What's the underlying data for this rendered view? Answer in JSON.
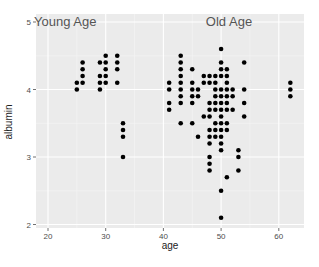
{
  "chart_data": {
    "type": "scatter",
    "title": "",
    "xlabel": "age",
    "ylabel": "albumin",
    "xlim": [
      18,
      64
    ],
    "ylim": [
      1.95,
      5.1
    ],
    "x_ticks": [
      20,
      30,
      40,
      50,
      60
    ],
    "y_ticks": [
      2,
      3,
      4,
      5
    ],
    "grid": true,
    "legend": null,
    "annotations": [
      {
        "text": "Young Age",
        "x": 26,
        "y": 5.0
      },
      {
        "text": "Old Age",
        "x": 50,
        "y": 5.0
      }
    ],
    "series": [
      {
        "name": "Young Age",
        "points": [
          [
            25,
            4.0
          ],
          [
            25,
            4.1
          ],
          [
            26,
            4.1
          ],
          [
            26,
            4.2
          ],
          [
            26,
            4.3
          ],
          [
            26,
            4.4
          ],
          [
            29,
            4.0
          ],
          [
            29,
            4.1
          ],
          [
            29,
            4.2
          ],
          [
            29,
            4.4
          ],
          [
            30,
            4.1
          ],
          [
            30,
            4.2
          ],
          [
            30,
            4.3
          ],
          [
            30,
            4.4
          ],
          [
            30,
            4.5
          ],
          [
            32,
            4.1
          ],
          [
            32,
            4.3
          ],
          [
            32,
            4.4
          ],
          [
            32,
            4.5
          ],
          [
            33,
            3.5
          ],
          [
            33,
            3.4
          ],
          [
            33,
            3.3
          ],
          [
            33,
            3.0
          ]
        ]
      },
      {
        "name": "Old Age",
        "points": [
          [
            41,
            3.7
          ],
          [
            41,
            3.8
          ],
          [
            41,
            4.0
          ],
          [
            41,
            4.1
          ],
          [
            43,
            3.5
          ],
          [
            43,
            3.8
          ],
          [
            43,
            3.9
          ],
          [
            43,
            4.0
          ],
          [
            43,
            4.1
          ],
          [
            43,
            4.2
          ],
          [
            43,
            4.3
          ],
          [
            43,
            4.4
          ],
          [
            43,
            4.5
          ],
          [
            45,
            3.5
          ],
          [
            45,
            3.8
          ],
          [
            45,
            3.9
          ],
          [
            45,
            4.0
          ],
          [
            45,
            4.1
          ],
          [
            45,
            4.3
          ],
          [
            46,
            3.3
          ],
          [
            46,
            3.9
          ],
          [
            46,
            4.0
          ],
          [
            47,
            3.6
          ],
          [
            47,
            4.1
          ],
          [
            47,
            4.2
          ],
          [
            48,
            2.8
          ],
          [
            48,
            2.9
          ],
          [
            48,
            3.0
          ],
          [
            48,
            3.2
          ],
          [
            48,
            3.3
          ],
          [
            48,
            3.4
          ],
          [
            48,
            3.6
          ],
          [
            48,
            3.7
          ],
          [
            48,
            3.8
          ],
          [
            48,
            4.1
          ],
          [
            48,
            4.2
          ],
          [
            49,
            3.3
          ],
          [
            49,
            3.4
          ],
          [
            49,
            3.5
          ],
          [
            49,
            3.7
          ],
          [
            49,
            3.8
          ],
          [
            49,
            3.9
          ],
          [
            49,
            4.0
          ],
          [
            49,
            4.1
          ],
          [
            49,
            4.2
          ],
          [
            50,
            2.1
          ],
          [
            50,
            2.5
          ],
          [
            50,
            3.1
          ],
          [
            50,
            3.2
          ],
          [
            50,
            3.3
          ],
          [
            50,
            3.4
          ],
          [
            50,
            3.5
          ],
          [
            50,
            3.6
          ],
          [
            50,
            3.7
          ],
          [
            50,
            3.8
          ],
          [
            50,
            3.9
          ],
          [
            50,
            4.0
          ],
          [
            50,
            4.2
          ],
          [
            50,
            4.3
          ],
          [
            50,
            4.4
          ],
          [
            50,
            4.6
          ],
          [
            51,
            2.7
          ],
          [
            51,
            3.4
          ],
          [
            51,
            3.5
          ],
          [
            51,
            3.7
          ],
          [
            51,
            3.8
          ],
          [
            51,
            3.9
          ],
          [
            51,
            4.0
          ],
          [
            51,
            4.1
          ],
          [
            51,
            4.2
          ],
          [
            51,
            4.3
          ],
          [
            52,
            3.7
          ],
          [
            52,
            3.9
          ],
          [
            52,
            4.0
          ],
          [
            53,
            2.8
          ],
          [
            53,
            3.0
          ],
          [
            53,
            3.1
          ],
          [
            54,
            3.6
          ],
          [
            54,
            3.8
          ],
          [
            54,
            4.0
          ],
          [
            54,
            4.4
          ],
          [
            62,
            3.9
          ],
          [
            62,
            4.0
          ],
          [
            62,
            4.1
          ]
        ]
      }
    ]
  },
  "colors": {
    "panel_bg": "#ebebeb",
    "grid_major": "#ffffff",
    "point": "#000000"
  }
}
